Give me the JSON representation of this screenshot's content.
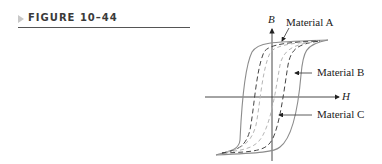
{
  "figure": {
    "label": "FIGURE 10–44"
  },
  "diagram": {
    "type": "hysteresis-loops",
    "axes": {
      "horizontal": "H",
      "vertical": "B"
    },
    "curves": [
      {
        "name": "Material A",
        "style": "solid",
        "color": "#8a8a8a"
      },
      {
        "name": "Material B",
        "style": "dashed",
        "color": "#444444"
      },
      {
        "name": "Material C",
        "style": "dashed",
        "color": "#b0b0b0"
      }
    ],
    "labels": {
      "material_a": "Material A",
      "material_b": "Material B",
      "material_c": "Material C"
    }
  }
}
